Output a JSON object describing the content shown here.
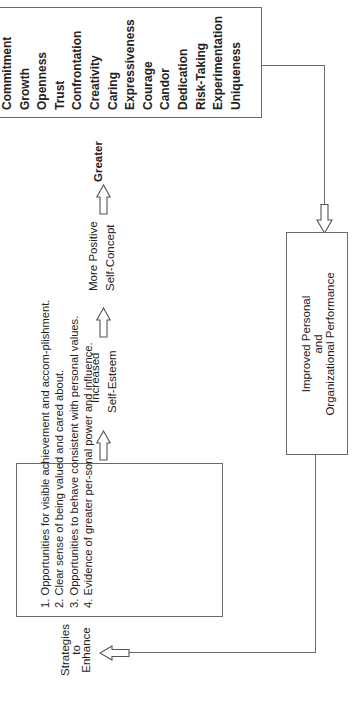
{
  "values_box": {
    "items": [
      "Commitment",
      "Growth",
      "Openness",
      "Trust",
      "Confrontation",
      "Creativity",
      "Caring",
      "Expressiveness",
      "Courage",
      "Candor",
      "Dedication",
      "Risk-Taking",
      "Experimentation",
      "Uniqueness"
    ]
  },
  "chain": {
    "greater": "Greater",
    "self_concept_line1": "More Positive",
    "self_concept_line2": "Self-Concept",
    "self_esteem_line1": "Increased",
    "self_esteem_line2": "Self-Esteem"
  },
  "performance_box": {
    "line1": "Improved Personal",
    "line2": "and",
    "line3": "Organizational Performance"
  },
  "strategies": {
    "label_line1": "Strategies",
    "label_line2": "to",
    "label_line3": "Enhance",
    "items": [
      "1. Opportunities for visible achievement and accom-plishment.",
      "2. Clear sense of being valued and cared about.",
      "3. Opportunities to behave consistent with personal values.",
      "4. Evidence of greater per-sonal power and influence."
    ]
  },
  "colors": {
    "line": "#6a6a6a",
    "text": "#222222",
    "background": "#ffffff"
  }
}
